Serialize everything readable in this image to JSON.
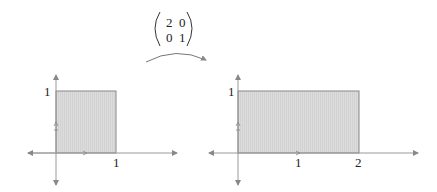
{
  "diagram": {
    "matrix": {
      "rows": [
        [
          "2",
          "0"
        ],
        [
          "0",
          "1"
        ]
      ]
    },
    "transform_arrow": {
      "direction": "left-to-right"
    },
    "colors": {
      "fill": "#d9d9d9",
      "stroke": "#888888",
      "axis": "#9a9a9a",
      "text": "#222222"
    },
    "before": {
      "name": "unit square",
      "x_label": "1",
      "y_label": "1",
      "width": 1,
      "height": 1
    },
    "after": {
      "name": "stretched rectangle",
      "x_labels": [
        "1",
        "2"
      ],
      "y_label": "1",
      "width": 2,
      "height": 1
    }
  }
}
